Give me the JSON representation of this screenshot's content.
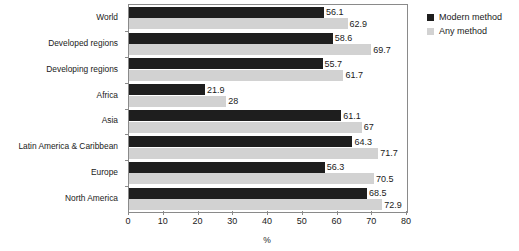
{
  "chart_data": {
    "type": "bar",
    "orientation": "horizontal",
    "title": "",
    "xlabel": "%",
    "ylabel": "",
    "xlim": [
      0,
      80
    ],
    "xticks": [
      0,
      10,
      20,
      30,
      40,
      50,
      60,
      70,
      80
    ],
    "grid": false,
    "legend_position": "right",
    "categories": [
      "World",
      "Developed regions",
      "Developing regions",
      "Africa",
      "Asia",
      "Latin America & Caribbean",
      "Europe",
      "North America"
    ],
    "series": [
      {
        "name": "Modern method",
        "color": "#1e1e1e",
        "values": [
          56.1,
          58.6,
          55.7,
          21.9,
          61.1,
          64.3,
          56.3,
          68.5
        ],
        "labels": [
          "56.1",
          "58.6",
          "55.7",
          "21.9",
          "61.1",
          "64.3",
          "56.3",
          "68.5"
        ]
      },
      {
        "name": "Any method",
        "color": "#d2d2d2",
        "values": [
          62.9,
          69.7,
          61.7,
          28,
          67,
          71.7,
          70.5,
          72.9
        ],
        "labels": [
          "62.9",
          "69.7",
          "61.7",
          "28",
          "67",
          "71.7",
          "70.5",
          "72.9"
        ]
      }
    ]
  },
  "legend": {
    "items": [
      {
        "label": "Modern method",
        "swatch": "modern"
      },
      {
        "label": "Any method",
        "swatch": "any"
      }
    ]
  },
  "axis": {
    "x_title": "%"
  }
}
